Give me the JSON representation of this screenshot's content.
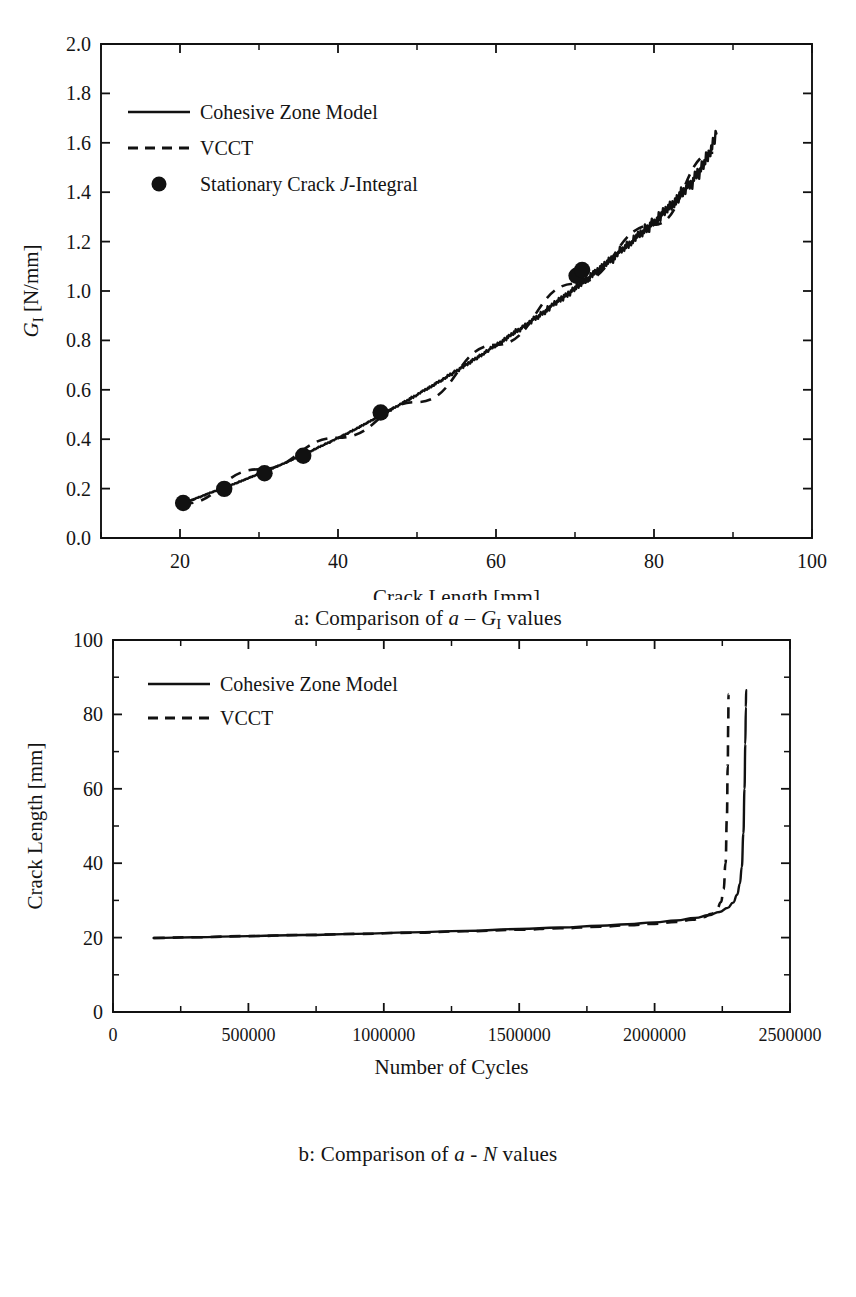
{
  "figure": {
    "caption_a_prefix": "a: Comparison of ",
    "caption_a_var1": "a",
    "caption_a_dash": " – ",
    "caption_a_var2": "G",
    "caption_a_sub2": "I",
    "caption_a_suffix": " values",
    "caption_b_prefix": "b: Comparison of ",
    "caption_b_var1": "a",
    "caption_b_dash": " - ",
    "caption_b_var2": "N",
    "caption_b_suffix": " values"
  },
  "chart_data": [
    {
      "id": "panel-a",
      "type": "line",
      "title": "",
      "xlabel": "Crack Length [mm]",
      "ylabel_var": "G",
      "ylabel_sub": "I",
      "ylabel_unit": " [N/mm]",
      "ylabel_full": "G_I [N/mm]",
      "xlim": [
        10,
        100
      ],
      "ylim": [
        0.0,
        2.0
      ],
      "xticks": [
        20,
        40,
        60,
        80,
        100
      ],
      "xticklabels": [
        "20",
        "40",
        "60",
        "80",
        "100"
      ],
      "x_minor_step": 10,
      "yticks": [
        0.0,
        0.2,
        0.4,
        0.6,
        0.8,
        1.0,
        1.2,
        1.4,
        1.6,
        1.8,
        2.0
      ],
      "yticklabels": [
        "0.0",
        "0.2",
        "0.4",
        "0.6",
        "0.8",
        "1.0",
        "1.2",
        "1.4",
        "1.6",
        "1.8",
        "2.0"
      ],
      "grid": false,
      "legend_position": "upper-left",
      "legend": [
        {
          "label": "Cohesive Zone Model",
          "style": "solid"
        },
        {
          "label": "VCCT",
          "style": "dashed"
        },
        {
          "label": "Stationary Crack J-Integral",
          "style": "marker",
          "label_pre": "Stationary Crack ",
          "label_it": "J",
          "label_post": "-Integral"
        }
      ],
      "series": [
        {
          "name": "Cohesive Zone Model",
          "style": "solid",
          "x": [
            20.3,
            21.5,
            22.8,
            24.1,
            25.4,
            26.7,
            28.0,
            29.4,
            30.8,
            32.2,
            33.6,
            35.0,
            36.5,
            38.0,
            39.5,
            41.0,
            42.5,
            44.0,
            45.5,
            47.0,
            48.6,
            50.2,
            51.8,
            53.4,
            55.0,
            56.6,
            58.2,
            59.8,
            61.4,
            63.0,
            64.6,
            66.2,
            67.8,
            69.4,
            71.0,
            72.6,
            74.2,
            75.8,
            77.4,
            79.0,
            80.6,
            82.2,
            83.8,
            85.2,
            86.4,
            87.3,
            87.9
          ],
          "y": [
            0.138,
            0.154,
            0.17,
            0.186,
            0.201,
            0.217,
            0.234,
            0.252,
            0.27,
            0.289,
            0.308,
            0.329,
            0.351,
            0.374,
            0.397,
            0.421,
            0.446,
            0.472,
            0.498,
            0.525,
            0.554,
            0.584,
            0.614,
            0.645,
            0.677,
            0.709,
            0.742,
            0.776,
            0.811,
            0.846,
            0.882,
            0.919,
            0.957,
            0.996,
            1.036,
            1.077,
            1.119,
            1.162,
            1.206,
            1.252,
            1.3,
            1.35,
            1.403,
            1.46,
            1.52,
            1.585,
            1.645
          ]
        },
        {
          "name": "VCCT",
          "style": "dashed",
          "note": "coincident with cohesive zone model curve",
          "x": [
            20.3,
            30.0,
            40.0,
            50.0,
            60.0,
            70.0,
            80.0,
            87.5
          ],
          "y": [
            0.138,
            0.278,
            0.406,
            0.55,
            0.782,
            1.03,
            1.268,
            1.56
          ]
        }
      ],
      "markers": {
        "name": "Stationary Crack J-Integral",
        "x": [
          20.4,
          25.6,
          30.7,
          35.6,
          45.4,
          70.2,
          70.9
        ],
        "y": [
          0.142,
          0.199,
          0.262,
          0.333,
          0.508,
          1.062,
          1.085
        ]
      }
    },
    {
      "id": "panel-b",
      "type": "line",
      "title": "",
      "xlabel": "Number of Cycles",
      "ylabel": "Crack Length [mm]",
      "xlim": [
        0,
        2500000
      ],
      "ylim": [
        0,
        100
      ],
      "xticks": [
        0,
        500000,
        1000000,
        1500000,
        2000000,
        2500000
      ],
      "xticklabels": [
        "0",
        "500000",
        "1000000",
        "1500000",
        "2000000",
        "2500000"
      ],
      "x_minor_step": 250000,
      "yticks": [
        0,
        20,
        40,
        60,
        80,
        100
      ],
      "yticklabels": [
        "0",
        "20",
        "40",
        "60",
        "80",
        "100"
      ],
      "y_minor_step": 10,
      "grid": false,
      "legend_position": "upper-left",
      "legend": [
        {
          "label": "Cohesive Zone Model",
          "style": "solid"
        },
        {
          "label": "VCCT",
          "style": "dashed"
        }
      ],
      "series": [
        {
          "name": "Cohesive Zone Model",
          "style": "solid",
          "x": [
            150000,
            300000,
            500000,
            700000,
            900000,
            1100000,
            1300000,
            1500000,
            1650000,
            1800000,
            1900000,
            2000000,
            2080000,
            2150000,
            2200000,
            2240000,
            2270000,
            2290000,
            2305000,
            2315000,
            2322000,
            2328000,
            2332000,
            2335000,
            2337000,
            2338000
          ],
          "y": [
            19.9,
            20.1,
            20.4,
            20.7,
            21.0,
            21.4,
            21.8,
            22.3,
            22.7,
            23.2,
            23.6,
            24.1,
            24.6,
            25.3,
            26.0,
            26.9,
            28.0,
            29.4,
            31.5,
            34.5,
            39.0,
            48.0,
            60.0,
            72.0,
            82.0,
            86.5
          ]
        },
        {
          "name": "VCCT",
          "style": "dashed",
          "x": [
            150000,
            300000,
            500000,
            700000,
            900000,
            1100000,
            1300000,
            1500000,
            1650000,
            1800000,
            1900000,
            2000000,
            2080000,
            2140000,
            2180000,
            2210000,
            2230000,
            2245000,
            2255000,
            2262000,
            2267000,
            2270000,
            2272000,
            2273000
          ],
          "y": [
            19.9,
            20.1,
            20.4,
            20.7,
            21.0,
            21.3,
            21.7,
            22.1,
            22.5,
            22.9,
            23.3,
            23.7,
            24.2,
            24.8,
            25.5,
            26.4,
            27.6,
            29.5,
            33.0,
            40.0,
            52.0,
            66.0,
            78.0,
            85.5
          ]
        }
      ]
    }
  ]
}
